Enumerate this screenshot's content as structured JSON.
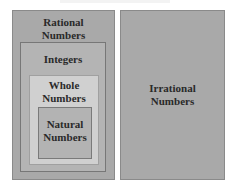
{
  "diagram": {
    "title_partial": "",
    "sets": {
      "rational": {
        "label_line1": "Rational",
        "label_line2": "Numbers",
        "color": "#a9a9a9"
      },
      "integers": {
        "label": "Integers",
        "color": "#b4b4b4"
      },
      "whole": {
        "label_line1": "Whole",
        "label_line2": "Numbers",
        "color": "#d0d0d0"
      },
      "natural": {
        "label_line1": "Natural",
        "label_line2": "Numbers",
        "color": "#b3b3b3"
      },
      "irrational": {
        "label_line1": "Irrational",
        "label_line2": "Numbers",
        "color": "#a9a9a9"
      }
    }
  }
}
